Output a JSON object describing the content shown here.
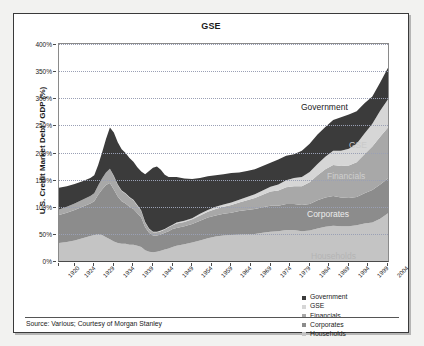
{
  "card": {
    "title": "GSE",
    "source": "Source: Various; Courtesy of Morgan Stanley"
  },
  "legend": {
    "position": "bottom-right",
    "items": [
      {
        "label": "Government",
        "color": "#3b3b3b"
      },
      {
        "label": "GSE",
        "color": "#d6d6d6"
      },
      {
        "label": "Financials",
        "color": "#a8a8a8"
      },
      {
        "label": "Corporates",
        "color": "#8c8c8c"
      },
      {
        "label": "Households",
        "color": "#c4c4c4"
      }
    ]
  },
  "annotations": [
    {
      "text": "Government",
      "color": "#1a1a1a",
      "x": 242,
      "y": 58
    },
    {
      "text": "GSE",
      "color": "#c9c9c9",
      "x": 290,
      "y": 96
    },
    {
      "text": "Financials",
      "color": "#cfcfcf",
      "x": 268,
      "y": 127
    },
    {
      "text": "Corporates",
      "color": "#ececec",
      "x": 248,
      "y": 165
    },
    {
      "text": "Households",
      "color": "#b4b4b4",
      "x": 252,
      "y": 207
    }
  ],
  "chart_data": {
    "type": "area",
    "stacked": true,
    "title": "GSE",
    "xlabel": "",
    "ylabel": "U.S. Credit Market Debt / GDP (%)",
    "ylim": [
      0,
      400
    ],
    "ytick_labels": [
      "0%",
      "50%",
      "100%",
      "150%",
      "200%",
      "250%",
      "300%",
      "350%",
      "400%"
    ],
    "ytick_values": [
      0,
      50,
      100,
      150,
      200,
      250,
      300,
      350,
      400
    ],
    "grid": true,
    "xlim": [
      1920,
      2004
    ],
    "xtick_labels": [
      "1920",
      "1924",
      "1929",
      "1934",
      "1939",
      "1944",
      "1949",
      "1954",
      "1959",
      "1964",
      "1969",
      "1974",
      "1979",
      "1984",
      "1989",
      "1994",
      "1999",
      "2004"
    ],
    "xtick_values": [
      1920,
      1924,
      1929,
      1934,
      1939,
      1944,
      1949,
      1954,
      1959,
      1964,
      1969,
      1974,
      1979,
      1984,
      1989,
      1994,
      1999,
      2004
    ],
    "x": [
      1920,
      1922,
      1924,
      1926,
      1928,
      1929,
      1930,
      1931,
      1932,
      1933,
      1934,
      1935,
      1936,
      1937,
      1938,
      1939,
      1940,
      1941,
      1942,
      1943,
      1944,
      1945,
      1946,
      1947,
      1948,
      1949,
      1950,
      1952,
      1954,
      1956,
      1958,
      1960,
      1962,
      1964,
      1966,
      1968,
      1970,
      1972,
      1974,
      1976,
      1978,
      1980,
      1982,
      1984,
      1986,
      1988,
      1990,
      1992,
      1994,
      1996,
      1998,
      2000,
      2002,
      2004
    ],
    "series": [
      {
        "name": "Households",
        "color": "#c4c4c4",
        "values": [
          33,
          35,
          38,
          42,
          46,
          48,
          50,
          48,
          44,
          40,
          36,
          33,
          32,
          32,
          30,
          30,
          28,
          26,
          20,
          17,
          16,
          17,
          19,
          21,
          23,
          26,
          28,
          31,
          34,
          38,
          42,
          45,
          47,
          48,
          49,
          50,
          50,
          52,
          54,
          55,
          57,
          57,
          55,
          56,
          60,
          63,
          65,
          64,
          64,
          66,
          69,
          71,
          78,
          88
        ]
      },
      {
        "name": "Corporates",
        "color": "#8c8c8c",
        "values": [
          52,
          54,
          56,
          58,
          60,
          62,
          72,
          84,
          96,
          104,
          96,
          86,
          78,
          74,
          70,
          66,
          60,
          54,
          42,
          35,
          31,
          30,
          30,
          31,
          32,
          33,
          33,
          33,
          34,
          36,
          38,
          39,
          40,
          41,
          43,
          44,
          46,
          47,
          48,
          47,
          48,
          48,
          48,
          49,
          52,
          54,
          55,
          53,
          52,
          52,
          56,
          60,
          63,
          64
        ]
      },
      {
        "name": "Financials",
        "color": "#a8a8a8",
        "values": [
          10,
          11,
          12,
          13,
          14,
          15,
          17,
          20,
          23,
          26,
          24,
          21,
          19,
          18,
          17,
          16,
          14,
          12,
          9,
          7,
          6,
          6,
          6,
          6,
          7,
          7,
          8,
          8,
          9,
          10,
          11,
          12,
          13,
          14,
          16,
          18,
          20,
          23,
          26,
          28,
          31,
          33,
          35,
          40,
          46,
          52,
          57,
          58,
          60,
          64,
          72,
          80,
          88,
          94
        ]
      },
      {
        "name": "GSE",
        "color": "#d6d6d6",
        "values": [
          0,
          0,
          0,
          0,
          0,
          0,
          0,
          0,
          0,
          0,
          1,
          1,
          1,
          1,
          1,
          1,
          1,
          1,
          1,
          1,
          1,
          1,
          1,
          1,
          1,
          1,
          2,
          2,
          2,
          3,
          3,
          4,
          4,
          5,
          5,
          6,
          7,
          8,
          9,
          11,
          13,
          15,
          17,
          19,
          21,
          23,
          26,
          28,
          31,
          34,
          38,
          42,
          48,
          52
        ]
      },
      {
        "name": "Government",
        "color": "#3b3b3b",
        "values": [
          40,
          38,
          36,
          34,
          33,
          33,
          38,
          48,
          62,
          76,
          80,
          78,
          76,
          74,
          72,
          70,
          70,
          72,
          88,
          106,
          118,
          120,
          112,
          100,
          92,
          88,
          84,
          78,
          72,
          66,
          62,
          58,
          56,
          54,
          50,
          48,
          46,
          45,
          44,
          46,
          45,
          44,
          48,
          52,
          54,
          55,
          57,
          62,
          63,
          60,
          56,
          50,
          52,
          58
        ]
      }
    ]
  }
}
